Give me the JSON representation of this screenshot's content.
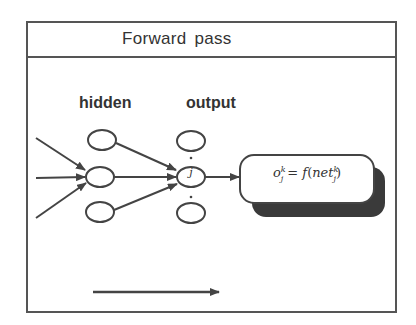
{
  "title": "Forward pass",
  "labels": {
    "hidden": "hidden",
    "output": "output"
  },
  "output_node_index": "j",
  "formula": {
    "lhs_base": "o",
    "lhs_sup": "k",
    "lhs_sub": "j",
    "equals": " = ",
    "func": "f",
    "open": "(",
    "arg_base": "net",
    "arg_sup": "k",
    "arg_sub": "j",
    "close": ")"
  },
  "layers": {
    "hidden_nodes": 3,
    "output_nodes": 3
  },
  "colors": {
    "stroke": "#444444",
    "shadow": "#3a3a3a",
    "text": "#333333"
  }
}
